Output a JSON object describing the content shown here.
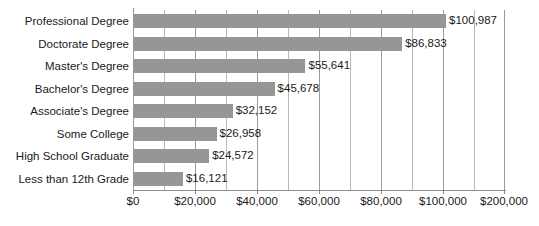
{
  "chart_data": {
    "type": "bar",
    "orientation": "horizontal",
    "title": "",
    "xlabel": "",
    "ylabel": "",
    "categories": [
      "Professional Degree",
      "Doctorate Degree",
      "Master's Degree",
      "Bachelor's Degree",
      "Associate's Degree",
      "Some College",
      "High School Graduate",
      "Less than 12th Grade"
    ],
    "values": [
      100987,
      86833,
      55641,
      45678,
      32152,
      26958,
      24572,
      16121
    ],
    "value_labels": [
      "$100,987",
      "$86,833",
      "$55,641",
      "$45,678",
      "$32,152",
      "$26,958",
      "$24,572",
      "$16,121"
    ],
    "xlim": [
      0,
      120000
    ],
    "xtick_values": [
      0,
      20000,
      40000,
      60000,
      80000,
      100000,
      120000
    ],
    "xtick_labels": [
      "$0",
      "$20,000",
      "$40,000",
      "$60,000",
      "$80,000",
      "$100,000",
      "$200,000"
    ],
    "minor_tick_values": [
      10000,
      30000,
      50000,
      70000,
      90000,
      110000
    ],
    "grid": true,
    "grid_axis": "x",
    "legend": null,
    "bar_color": "#969696",
    "gridline_color": "#9a9a9a",
    "axis_color": "#8c8c8c",
    "text_color": "#1a1a1a"
  }
}
